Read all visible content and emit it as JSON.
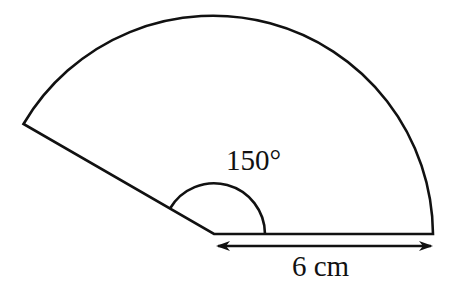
{
  "diagram": {
    "type": "circular-sector",
    "angle_label": "150°",
    "radius_label": "6 cm",
    "angle_degrees": 150,
    "radius_cm": 6,
    "colors": {
      "stroke": "#111111",
      "background": "#ffffff"
    }
  }
}
